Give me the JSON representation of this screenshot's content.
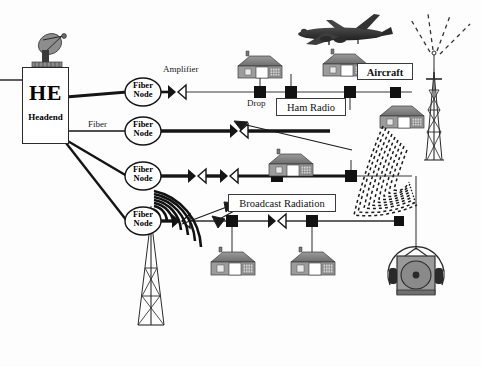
{
  "diagram": {
    "background_color": "#fdfdfd",
    "line_color": "#1a1a1a",
    "headend": {
      "title": "HE",
      "subtitle": "Headend",
      "dish_name": "satellite-dish"
    },
    "labels": {
      "amplifier": "Amplifier",
      "fiber": "Fiber",
      "drop": "Drop",
      "aircraft": "Aircraft",
      "ham_radio": "Ham Radio",
      "broadcast_radiation": "Broadcast Radiation"
    },
    "fiber_nodes": [
      {
        "line1": "Fiber",
        "line2": "Node",
        "cx": 143,
        "cy": 92
      },
      {
        "line1": "Fiber",
        "line2": "Node",
        "cx": 143,
        "cy": 131
      },
      {
        "line1": "Fiber",
        "line2": "Node",
        "cx": 143,
        "cy": 176
      },
      {
        "line1": "Fiber",
        "line2": "Node",
        "cx": 143,
        "cy": 221
      }
    ],
    "trunk_rows": [
      {
        "y": 92,
        "thick": false
      },
      {
        "y": 131,
        "thick": true
      },
      {
        "y": 176,
        "thick": true
      },
      {
        "y": 221,
        "thick": true
      }
    ],
    "amplifiers": [
      {
        "x": 176,
        "y": 92
      },
      {
        "x": 238,
        "y": 131
      },
      {
        "x": 196,
        "y": 176
      },
      {
        "x": 228,
        "y": 176
      },
      {
        "x": 276,
        "y": 221
      },
      {
        "x": 180,
        "y": 221
      }
    ],
    "taps": [
      {
        "x": 260,
        "y": 92
      },
      {
        "x": 291,
        "y": 92
      },
      {
        "x": 350,
        "y": 92
      },
      {
        "x": 396,
        "y": 92
      },
      {
        "x": 351,
        "y": 176
      },
      {
        "x": 277,
        "y": 176
      },
      {
        "x": 232,
        "y": 221
      },
      {
        "x": 312,
        "y": 221
      }
    ],
    "houses": [
      {
        "x": 259,
        "y": 64
      },
      {
        "x": 344,
        "y": 62
      },
      {
        "x": 401,
        "y": 115
      },
      {
        "x": 290,
        "y": 163
      },
      {
        "x": 242,
        "y": 252
      },
      {
        "x": 322,
        "y": 252
      }
    ],
    "icons": {
      "aircraft": "airplane-icon",
      "tower_right": "ham-radio-tower-icon",
      "tower_left": "broadcast-tower-icon",
      "receiver": "radio-receiver-icon"
    }
  }
}
